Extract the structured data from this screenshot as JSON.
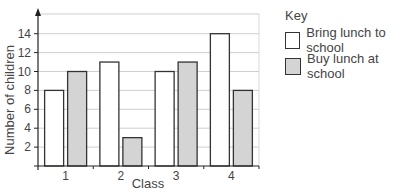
{
  "chart_data": {
    "type": "bar",
    "title": "",
    "xlabel": "Class",
    "ylabel": "Number of children",
    "categories": [
      "1",
      "2",
      "3",
      "4"
    ],
    "series": [
      {
        "name": "Bring lunch to school",
        "values": [
          8,
          11,
          10,
          14
        ],
        "color": "#ffffff"
      },
      {
        "name": "Buy lunch at school",
        "values": [
          10,
          3,
          11,
          8
        ],
        "color": "#d4d4d4"
      }
    ],
    "yticks": [
      2,
      4,
      6,
      8,
      10,
      12,
      14
    ],
    "ylim": [
      0,
      15
    ],
    "grid": true,
    "legend_title": "Key",
    "legend_position": "right"
  }
}
